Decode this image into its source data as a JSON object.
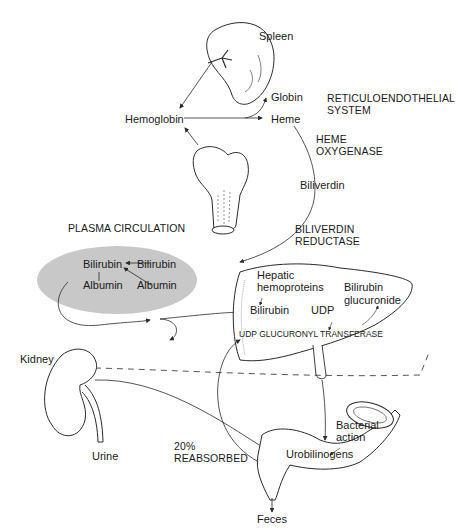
{
  "diagram": {
    "organs": {
      "spleen": "Spleen",
      "kidney": "Kidney"
    },
    "labels": {
      "hemoglobin": "Hemoglobin",
      "globin": "Globin",
      "heme": "Heme",
      "reticuloendothelial_line1": "RETICULOENDOTHELIAL",
      "reticuloendothelial_line2": "SYSTEM",
      "heme_oxygenase_line1": "HEME",
      "heme_oxygenase_line2": "OXYGENASE",
      "biliverdin": "Biliverdin",
      "biliverdin_reductase_line1": "BILIVERDIN",
      "biliverdin_reductase_line2": "REDUCTASE",
      "plasma_circulation": "PLASMA CIRCULATION",
      "plasma_bilirubin_bound": "Bilirubin",
      "plasma_albumin_bound": "Albumin",
      "plasma_bilirubin_free": "Bilirubin",
      "plasma_albumin_free": "Albumin",
      "hepatic_line1": "Hepatic",
      "hepatic_line2": "hemoproteins",
      "liver_bilirubin": "Bilirubin",
      "udp": "UDP",
      "glucuronide_line1": "Bilirubin",
      "glucuronide_line2": "glucuronide",
      "udp_transferase": "UDP GLUCURONYL TRANSFERASE",
      "urine": "Urine",
      "reabsorbed_pct": "20%",
      "reabsorbed": "REABSORBED",
      "bacterial_line1": "Bacterial",
      "bacterial_line2": "action",
      "urobilinogens": "Urobilinogens",
      "feces": "Feces"
    },
    "colors": {
      "line": "#2a2a2a",
      "plasma_fill": "#c8c8c8",
      "background": "#ffffff"
    }
  }
}
